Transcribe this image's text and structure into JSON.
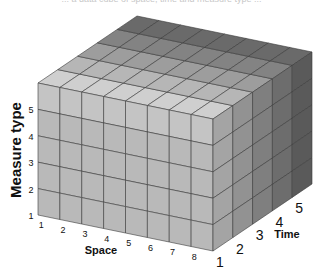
{
  "caption": "... a data cube of space, time and measure type ...",
  "diagram": {
    "type": "data-cube",
    "axes": {
      "x": {
        "label": "Space",
        "ticks": [
          "1",
          "2",
          "3",
          "4",
          "5",
          "6",
          "7",
          "8"
        ]
      },
      "y": {
        "label": "Measure type",
        "ticks": [
          "1",
          "2",
          "3",
          "4",
          "5"
        ]
      },
      "z": {
        "label": "Time",
        "ticks": [
          "1",
          "2",
          "3",
          "4",
          "5"
        ]
      }
    },
    "geometry": {
      "front_top_left": [
        38,
        83
      ],
      "space_step": [
        21.875,
        4.5
      ],
      "time_step": [
        19.8,
        -13.4
      ],
      "measure_step": [
        0,
        26.4
      ],
      "space_count": 8,
      "time_count": 5,
      "measure_count": 5
    },
    "colors": {
      "front_face": "#b9b9b9",
      "top_front_row": "#cfcfcf",
      "top_back_row": "#6a6a6a",
      "side_front": "#a4a4a4",
      "side_back": "#5a5a5a",
      "grid_line": "#333333"
    }
  }
}
